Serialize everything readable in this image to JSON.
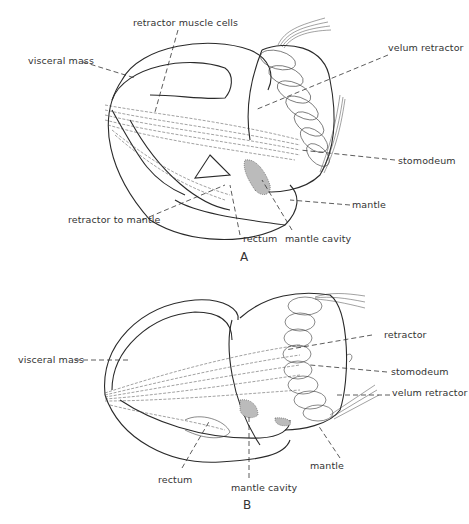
{
  "figure_a": {
    "letter": "A",
    "labels": {
      "retractor_muscle_cells": "retractor muscle cells",
      "visceral_mass": "visceral mass",
      "velum_retractor": "velum retractor",
      "stomodeum": "stomodeum",
      "mantle": "mantle",
      "retractor_to_mantle": "retractor to mantle",
      "rectum": "rectum",
      "mantle_cavity": "mantle cavity"
    }
  },
  "figure_b": {
    "letter": "B",
    "labels": {
      "visceral_mass": "visceral mass",
      "retractor": "retractor",
      "stomodeum": "stomodeum",
      "velum_retractor": "velum retractor",
      "mantle": "mantle",
      "rectum": "rectum",
      "mantle_cavity": "mantle cavity"
    }
  },
  "colors": {
    "line": "#2a2a2a",
    "background": "#ffffff",
    "stipple": "#bbbbbb"
  }
}
